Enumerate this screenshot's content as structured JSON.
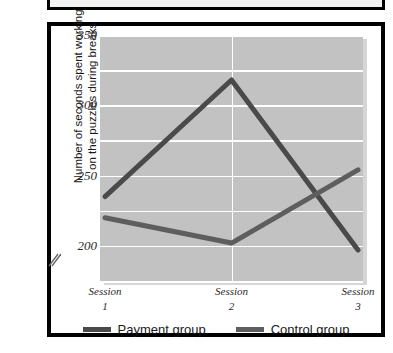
{
  "chart_data": {
    "type": "line",
    "title": "",
    "subtitle": "",
    "xlabel": "",
    "ylabel": "Number of seconds spent working on the puzzles during breaks",
    "ylabel_line1": "Number of seconds spent working",
    "ylabel_line2": "on the puzzles during breaks",
    "categories": [
      "Session 1",
      "Session 2",
      "Session 3"
    ],
    "category_lines": [
      {
        "word": "Session",
        "number": "1"
      },
      {
        "word": "Session",
        "number": "2"
      },
      {
        "word": "Session",
        "number": "3"
      }
    ],
    "series": [
      {
        "name": "Payment group",
        "values": [
          235,
          318,
          197
        ],
        "color": "#4a4a4a"
      },
      {
        "name": "Control group",
        "values": [
          220,
          202,
          254
        ],
        "color": "#5e5e5e"
      }
    ],
    "ylim": [
      175,
      350
    ],
    "ytick_labels": [
      "350",
      "300",
      "250",
      "200"
    ],
    "ytick_values": [
      350,
      300,
      250,
      200
    ],
    "gridline_values": [
      350,
      325,
      300,
      275,
      250,
      225,
      200,
      175
    ],
    "grid": true,
    "axis_break": true,
    "axis_break_symbol": "//",
    "legend_position": "bottom",
    "plot_background": "#c2c2c2",
    "gridline_color": "#ffffff"
  },
  "legend": {
    "items": [
      {
        "label": "Payment group",
        "color": "#4a4a4a"
      },
      {
        "label": "Control group",
        "color": "#5e5e5e"
      }
    ]
  }
}
